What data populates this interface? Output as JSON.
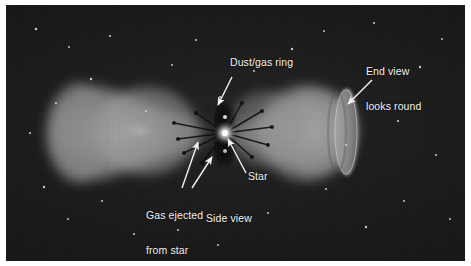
{
  "figure": {
    "frame_color": "#ffffff",
    "plate_color": "#1a1a1a",
    "label_color": "#f2f2f2",
    "nebula_color": "#8e8e8e",
    "star_color": "#ffffff"
  },
  "annotations": [
    {
      "id": "dust-gas-ring",
      "text": "Dust/gas ring",
      "lines": [
        "Dust/gas ring"
      ],
      "x": 224,
      "y": 58,
      "arrow": {
        "from_x": 226,
        "from_y": 72,
        "to_x": 212,
        "to_y": 100
      }
    },
    {
      "id": "end-view-looks-round",
      "text": "End view looks round",
      "lines": [
        "End view",
        "looks round"
      ],
      "x": 360,
      "y": 44,
      "arrow": {
        "from_x": 366,
        "from_y": 75,
        "to_x": 342,
        "to_y": 99
      }
    },
    {
      "id": "star",
      "text": "Star",
      "lines": [
        "Star"
      ],
      "x": 242,
      "y": 170,
      "arrow": {
        "from_x": 240,
        "from_y": 168,
        "to_x": 221,
        "to_y": 133
      }
    },
    {
      "id": "gas-ejected-from-star",
      "text": "Gas ejected from star",
      "lines": [
        "Gas ejected",
        "from star"
      ],
      "x": 140,
      "y": 186,
      "arrow_1": {
        "from_x": 176,
        "from_y": 183,
        "to_x": 192,
        "to_y": 137
      },
      "arrow_2": {
        "from_x": 186,
        "from_y": 183,
        "to_x": 206,
        "to_y": 152
      }
    },
    {
      "id": "side-view",
      "text": "Side view",
      "lines": [
        "Side view"
      ],
      "x": 200,
      "y": 212,
      "arrow": null
    }
  ],
  "scene": {
    "background_stars": [
      {
        "x": 30,
        "y": 24,
        "r": 1.3
      },
      {
        "x": 63,
        "y": 42,
        "r": 1.0
      },
      {
        "x": 104,
        "y": 31,
        "r": 1.1
      },
      {
        "x": 85,
        "y": 74,
        "r": 1.2
      },
      {
        "x": 50,
        "y": 98,
        "r": 1.0
      },
      {
        "x": 24,
        "y": 128,
        "r": 1.1
      },
      {
        "x": 38,
        "y": 182,
        "r": 1.2
      },
      {
        "x": 62,
        "y": 214,
        "r": 1.0
      },
      {
        "x": 96,
        "y": 196,
        "r": 1.0
      },
      {
        "x": 128,
        "y": 229,
        "r": 1.1
      },
      {
        "x": 166,
        "y": 60,
        "r": 1.0
      },
      {
        "x": 190,
        "y": 35,
        "r": 1.1
      },
      {
        "x": 214,
        "y": 92,
        "r": 1.1
      },
      {
        "x": 172,
        "y": 225,
        "r": 1.0
      },
      {
        "x": 212,
        "y": 240,
        "r": 1.0
      },
      {
        "x": 262,
        "y": 208,
        "r": 1.0
      },
      {
        "x": 286,
        "y": 44,
        "r": 1.2
      },
      {
        "x": 318,
        "y": 26,
        "r": 1.0
      },
      {
        "x": 340,
        "y": 140,
        "r": 1.0
      },
      {
        "x": 368,
        "y": 18,
        "r": 1.1
      },
      {
        "x": 392,
        "y": 116,
        "r": 1.1
      },
      {
        "x": 414,
        "y": 62,
        "r": 1.2
      },
      {
        "x": 436,
        "y": 34,
        "r": 1.0
      },
      {
        "x": 430,
        "y": 150,
        "r": 1.1
      },
      {
        "x": 398,
        "y": 196,
        "r": 1.0
      },
      {
        "x": 360,
        "y": 222,
        "r": 1.2
      },
      {
        "x": 320,
        "y": 184,
        "r": 1.0
      },
      {
        "x": 444,
        "y": 214,
        "r": 1.0
      },
      {
        "x": 140,
        "y": 106,
        "r": 1.0
      },
      {
        "x": 248,
        "y": 66,
        "r": 1.0
      }
    ],
    "central_star": {
      "x": 219,
      "y": 128,
      "r": 3.2
    },
    "left_lobe_label": "Side-view cone",
    "right_lobe_label": "End-view cone"
  }
}
